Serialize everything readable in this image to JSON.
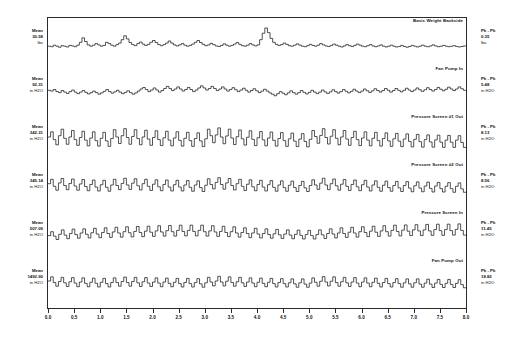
{
  "chart_data": {
    "type": "line",
    "title": "",
    "xlabel": "",
    "ylabel": "",
    "xlim": [
      0.0,
      8.0
    ],
    "grid": false,
    "legend_position": "none",
    "xticks": [
      "0.0",
      "0.5",
      "1.0",
      "1.5",
      "2.0",
      "2.5",
      "3.0",
      "3.5",
      "4.0",
      "4.5",
      "5.0",
      "5.5",
      "6.0",
      "6.5",
      "7.0",
      "7.5",
      "8.0"
    ],
    "panels": [
      {
        "title": "Basis Weight Backside",
        "mean_label": "Mean",
        "mean_value": "30.58",
        "mean_units": "lbs",
        "pkpk_label": "Pk - Pk",
        "pkpk_value": "0.35",
        "pkpk_units": "lbs",
        "values": [
          0.3,
          0.28,
          0.34,
          0.3,
          0.26,
          0.32,
          0.3,
          0.27,
          0.33,
          0.31,
          0.28,
          0.34,
          0.45,
          0.62,
          0.48,
          0.35,
          0.3,
          0.34,
          0.4,
          0.35,
          0.3,
          0.33,
          0.45,
          0.4,
          0.34,
          0.3,
          0.36,
          0.42,
          0.55,
          0.7,
          0.58,
          0.44,
          0.36,
          0.32,
          0.4,
          0.46,
          0.38,
          0.33,
          0.37,
          0.45,
          0.52,
          0.44,
          0.36,
          0.32,
          0.36,
          0.42,
          0.5,
          0.42,
          0.35,
          0.31,
          0.35,
          0.4,
          0.34,
          0.3,
          0.33,
          0.38,
          0.45,
          0.52,
          0.44,
          0.37,
          0.32,
          0.35,
          0.41,
          0.36,
          0.31,
          0.29,
          0.33,
          0.39,
          0.34,
          0.3,
          0.33,
          0.38,
          0.44,
          0.37,
          0.32,
          0.3,
          0.34,
          0.4,
          0.35,
          0.31,
          0.35,
          0.55,
          0.8,
          1.0,
          0.82,
          0.6,
          0.45,
          0.37,
          0.33,
          0.36,
          0.42,
          0.37,
          0.32,
          0.3,
          0.34,
          0.39,
          0.34,
          0.3,
          0.28,
          0.32,
          0.37,
          0.33,
          0.3,
          0.34,
          0.4,
          0.35,
          0.31,
          0.29,
          0.33,
          0.38,
          0.34,
          0.3,
          0.27,
          0.31,
          0.36,
          0.32,
          0.29,
          0.33,
          0.38,
          0.34,
          0.3,
          0.28,
          0.32,
          0.36,
          0.31,
          0.28,
          0.31,
          0.35,
          0.3,
          0.27,
          0.3,
          0.34,
          0.3,
          0.27,
          0.29,
          0.33,
          0.29,
          0.26,
          0.29,
          0.33,
          0.3,
          0.27,
          0.3,
          0.34,
          0.3,
          0.28,
          0.31,
          0.35,
          0.31,
          0.28,
          0.3,
          0.33,
          0.3,
          0.28,
          0.3,
          0.32,
          0.29,
          0.27,
          0.29,
          0.31
        ]
      },
      {
        "title": "Fan Pump In",
        "mean_label": "Mean",
        "mean_value": "92.31",
        "mean_units": "in H2O",
        "pkpk_label": "Pk - Pk",
        "pkpk_value": "5.48",
        "pkpk_units": "in H2O",
        "values": [
          0.45,
          0.42,
          0.48,
          0.4,
          0.36,
          0.44,
          0.38,
          0.33,
          0.4,
          0.46,
          0.38,
          0.32,
          0.38,
          0.44,
          0.37,
          0.31,
          0.36,
          0.42,
          0.36,
          0.3,
          0.35,
          0.41,
          0.48,
          0.4,
          0.34,
          0.39,
          0.45,
          0.38,
          0.32,
          0.37,
          0.43,
          0.36,
          0.3,
          0.35,
          0.42,
          0.5,
          0.56,
          0.48,
          0.4,
          0.46,
          0.54,
          0.46,
          0.38,
          0.44,
          0.52,
          0.6,
          0.52,
          0.44,
          0.5,
          0.58,
          0.5,
          0.42,
          0.48,
          0.56,
          0.48,
          0.4,
          0.46,
          0.54,
          0.62,
          0.54,
          0.46,
          0.52,
          0.6,
          0.52,
          0.44,
          0.5,
          0.58,
          0.5,
          0.42,
          0.48,
          0.55,
          0.47,
          0.4,
          0.46,
          0.53,
          0.45,
          0.38,
          0.44,
          0.51,
          0.43,
          0.36,
          0.42,
          0.49,
          0.42,
          0.35,
          0.3,
          0.24,
          0.32,
          0.4,
          0.34,
          0.28,
          0.35,
          0.43,
          0.36,
          0.3,
          0.36,
          0.44,
          0.37,
          0.31,
          0.37,
          0.45,
          0.38,
          0.32,
          0.38,
          0.46,
          0.39,
          0.33,
          0.39,
          0.47,
          0.4,
          0.34,
          0.4,
          0.48,
          0.41,
          0.35,
          0.41,
          0.49,
          0.42,
          0.36,
          0.42,
          0.5,
          0.43,
          0.37,
          0.43,
          0.51,
          0.44,
          0.38,
          0.44,
          0.52,
          0.45,
          0.38,
          0.44,
          0.52,
          0.45,
          0.39,
          0.45,
          0.53,
          0.46,
          0.4,
          0.46,
          0.54,
          0.47,
          0.41,
          0.47,
          0.55,
          0.48,
          0.42,
          0.48,
          0.56,
          0.49,
          0.43,
          0.49,
          0.57,
          0.5,
          0.44,
          0.5,
          0.58,
          0.51,
          0.45
        ]
      },
      {
        "title": "Pressure Screen #1 Out",
        "mean_label": "Mean",
        "mean_value": "342.31",
        "mean_units": "in H2O",
        "pkpk_label": "Pk - Pk",
        "pkpk_value": "8.13",
        "pkpk_units": "in H2O",
        "values": [
          0.5,
          0.7,
          0.4,
          0.2,
          0.55,
          0.8,
          0.45,
          0.22,
          0.5,
          0.75,
          0.4,
          0.18,
          0.48,
          0.72,
          0.38,
          0.16,
          0.46,
          0.7,
          0.36,
          0.15,
          0.45,
          0.68,
          0.35,
          0.14,
          0.44,
          0.78,
          0.5,
          0.25,
          0.55,
          0.82,
          0.48,
          0.22,
          0.52,
          0.78,
          0.44,
          0.2,
          0.5,
          0.76,
          0.42,
          0.18,
          0.48,
          0.74,
          0.4,
          0.17,
          0.47,
          0.72,
          0.38,
          0.16,
          0.46,
          0.7,
          0.37,
          0.15,
          0.45,
          0.68,
          0.36,
          0.14,
          0.44,
          0.66,
          0.35,
          0.13,
          0.43,
          0.8,
          0.55,
          0.28,
          0.58,
          0.85,
          0.5,
          0.24,
          0.54,
          0.8,
          0.46,
          0.21,
          0.51,
          0.77,
          0.43,
          0.19,
          0.49,
          0.74,
          0.41,
          0.17,
          0.47,
          0.71,
          0.39,
          0.16,
          0.46,
          0.69,
          0.37,
          0.15,
          0.44,
          0.67,
          0.36,
          0.14,
          0.43,
          0.65,
          0.34,
          0.13,
          0.42,
          0.63,
          0.33,
          0.12,
          0.41,
          0.75,
          0.52,
          0.26,
          0.56,
          0.82,
          0.48,
          0.23,
          0.53,
          0.78,
          0.45,
          0.2,
          0.5,
          0.75,
          0.42,
          0.18,
          0.48,
          0.72,
          0.4,
          0.17,
          0.46,
          0.7,
          0.38,
          0.16,
          0.45,
          0.68,
          0.36,
          0.15,
          0.44,
          0.66,
          0.35,
          0.14,
          0.43,
          0.64,
          0.34,
          0.13,
          0.42,
          0.62,
          0.33,
          0.12,
          0.41,
          0.6,
          0.32,
          0.11,
          0.4,
          0.58,
          0.31,
          0.11,
          0.39,
          0.57,
          0.3,
          0.1,
          0.38,
          0.56,
          0.3,
          0.1,
          0.38,
          0.55,
          0.29,
          0.1
        ]
      },
      {
        "title": "Pressure Screen #2 Out",
        "mean_label": "Mean",
        "mean_value": "345.14",
        "mean_units": "in H2O",
        "pkpk_label": "Pk - Pk",
        "pkpk_value": "8.56",
        "pkpk_units": "in H2O",
        "values": [
          0.55,
          0.72,
          0.45,
          0.3,
          0.58,
          0.75,
          0.48,
          0.32,
          0.56,
          0.73,
          0.46,
          0.3,
          0.54,
          0.71,
          0.44,
          0.28,
          0.52,
          0.69,
          0.42,
          0.27,
          0.51,
          0.68,
          0.41,
          0.26,
          0.5,
          0.72,
          0.48,
          0.32,
          0.56,
          0.76,
          0.5,
          0.33,
          0.57,
          0.74,
          0.47,
          0.31,
          0.55,
          0.72,
          0.45,
          0.29,
          0.53,
          0.7,
          0.43,
          0.28,
          0.52,
          0.69,
          0.42,
          0.27,
          0.51,
          0.68,
          0.42,
          0.27,
          0.5,
          0.67,
          0.41,
          0.26,
          0.5,
          0.66,
          0.4,
          0.25,
          0.49,
          0.74,
          0.52,
          0.35,
          0.6,
          0.78,
          0.52,
          0.34,
          0.58,
          0.75,
          0.48,
          0.31,
          0.55,
          0.72,
          0.45,
          0.29,
          0.53,
          0.7,
          0.43,
          0.28,
          0.52,
          0.68,
          0.42,
          0.27,
          0.51,
          0.67,
          0.41,
          0.26,
          0.5,
          0.66,
          0.4,
          0.26,
          0.49,
          0.65,
          0.4,
          0.25,
          0.48,
          0.64,
          0.39,
          0.25,
          0.48,
          0.7,
          0.5,
          0.33,
          0.57,
          0.76,
          0.5,
          0.32,
          0.55,
          0.73,
          0.47,
          0.3,
          0.53,
          0.71,
          0.45,
          0.29,
          0.52,
          0.69,
          0.43,
          0.28,
          0.51,
          0.68,
          0.42,
          0.27,
          0.5,
          0.66,
          0.41,
          0.26,
          0.49,
          0.65,
          0.4,
          0.26,
          0.48,
          0.64,
          0.39,
          0.25,
          0.48,
          0.63,
          0.38,
          0.24,
          0.47,
          0.62,
          0.38,
          0.24,
          0.46,
          0.61,
          0.37,
          0.23,
          0.46,
          0.6,
          0.36,
          0.23,
          0.45,
          0.59,
          0.36,
          0.22,
          0.45,
          0.58,
          0.35,
          0.22
        ]
      },
      {
        "title": "Pressure Screen In",
        "mean_label": "Mean",
        "mean_value": "507.09",
        "mean_units": "in H2O",
        "pkpk_label": "Pk - Pk",
        "pkpk_value": "11.45",
        "pkpk_units": "in H2O",
        "values": [
          0.4,
          0.55,
          0.38,
          0.25,
          0.45,
          0.62,
          0.42,
          0.28,
          0.48,
          0.65,
          0.44,
          0.3,
          0.5,
          0.66,
          0.45,
          0.31,
          0.51,
          0.68,
          0.46,
          0.32,
          0.52,
          0.7,
          0.48,
          0.33,
          0.54,
          0.72,
          0.5,
          0.34,
          0.55,
          0.74,
          0.51,
          0.35,
          0.56,
          0.75,
          0.52,
          0.36,
          0.57,
          0.76,
          0.53,
          0.37,
          0.58,
          0.78,
          0.54,
          0.38,
          0.59,
          0.79,
          0.55,
          0.38,
          0.6,
          0.8,
          0.56,
          0.39,
          0.6,
          0.8,
          0.56,
          0.39,
          0.6,
          0.8,
          0.55,
          0.38,
          0.58,
          0.78,
          0.54,
          0.37,
          0.56,
          0.76,
          0.52,
          0.36,
          0.55,
          0.74,
          0.5,
          0.34,
          0.52,
          0.7,
          0.48,
          0.32,
          0.5,
          0.68,
          0.46,
          0.31,
          0.48,
          0.66,
          0.44,
          0.3,
          0.47,
          0.64,
          0.43,
          0.29,
          0.46,
          0.62,
          0.42,
          0.28,
          0.45,
          0.61,
          0.41,
          0.27,
          0.44,
          0.6,
          0.4,
          0.27,
          0.44,
          0.62,
          0.43,
          0.29,
          0.48,
          0.66,
          0.46,
          0.31,
          0.5,
          0.7,
          0.48,
          0.33,
          0.53,
          0.72,
          0.5,
          0.34,
          0.55,
          0.74,
          0.52,
          0.36,
          0.57,
          0.76,
          0.53,
          0.37,
          0.58,
          0.78,
          0.55,
          0.38,
          0.6,
          0.8,
          0.56,
          0.39,
          0.61,
          0.81,
          0.57,
          0.4,
          0.62,
          0.82,
          0.58,
          0.4,
          0.62,
          0.83,
          0.58,
          0.41,
          0.63,
          0.84,
          0.59,
          0.41,
          0.63,
          0.84,
          0.59,
          0.42,
          0.64,
          0.85,
          0.6,
          0.42
        ]
      },
      {
        "title": "Fan Pump Out",
        "mean_label": "Mean",
        "mean_value": "1492.90",
        "mean_units": "in H2O",
        "pkpk_label": "Pk - Pk",
        "pkpk_value": "18.82",
        "pkpk_units": "in H2O",
        "values": [
          0.5,
          0.66,
          0.44,
          0.3,
          0.48,
          0.64,
          0.43,
          0.29,
          0.47,
          0.63,
          0.42,
          0.28,
          0.46,
          0.62,
          0.41,
          0.28,
          0.45,
          0.61,
          0.41,
          0.27,
          0.45,
          0.6,
          0.4,
          0.27,
          0.44,
          0.62,
          0.44,
          0.3,
          0.48,
          0.65,
          0.44,
          0.3,
          0.48,
          0.64,
          0.43,
          0.29,
          0.47,
          0.63,
          0.42,
          0.29,
          0.46,
          0.62,
          0.42,
          0.28,
          0.46,
          0.61,
          0.41,
          0.28,
          0.45,
          0.6,
          0.4,
          0.27,
          0.44,
          0.6,
          0.4,
          0.27,
          0.44,
          0.59,
          0.39,
          0.26,
          0.43,
          0.64,
          0.46,
          0.31,
          0.5,
          0.68,
          0.46,
          0.31,
          0.49,
          0.66,
          0.44,
          0.3,
          0.47,
          0.64,
          0.43,
          0.29,
          0.46,
          0.62,
          0.42,
          0.28,
          0.45,
          0.61,
          0.41,
          0.28,
          0.45,
          0.6,
          0.4,
          0.27,
          0.44,
          0.59,
          0.4,
          0.27,
          0.43,
          0.58,
          0.39,
          0.26,
          0.43,
          0.58,
          0.38,
          0.26,
          0.42,
          0.62,
          0.45,
          0.3,
          0.49,
          0.67,
          0.46,
          0.31,
          0.49,
          0.66,
          0.44,
          0.3,
          0.47,
          0.64,
          0.43,
          0.29,
          0.46,
          0.63,
          0.42,
          0.28,
          0.46,
          0.62,
          0.42,
          0.28,
          0.45,
          0.61,
          0.41,
          0.27,
          0.44,
          0.6,
          0.4,
          0.27,
          0.44,
          0.59,
          0.4,
          0.26,
          0.43,
          0.58,
          0.39,
          0.26,
          0.43,
          0.58,
          0.38,
          0.26,
          0.42,
          0.57,
          0.38,
          0.25,
          0.42,
          0.56,
          0.37,
          0.25,
          0.41,
          0.56,
          0.37,
          0.25,
          0.41,
          0.55,
          0.36,
          0.24
        ]
      }
    ]
  }
}
